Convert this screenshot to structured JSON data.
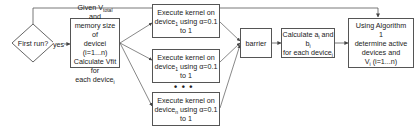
{
  "decision": {
    "label": "First run?",
    "yes_label": "yes",
    "no_label": "no"
  },
  "init_box": {
    "line1_pre": "Given V",
    "line1_sub": "total",
    "line1_post": " and",
    "line2": "memory size of",
    "line3": "devicei (i=1...n)",
    "line4": "Calculate Vfit for",
    "line5_pre": "each device",
    "line5_sub": "i"
  },
  "exec_boxes": [
    {
      "line1": "Execute kernel on",
      "line2_pre": "device",
      "line2_sub": "1",
      "line2_post": " using α=0.1",
      "line3": "to 1"
    },
    {
      "line1": "Execute kernel on",
      "line2_pre": "device",
      "line2_sub": "1",
      "line2_post": " using α=0.1",
      "line3": "to 1"
    },
    {
      "line1": "Execute kernel on",
      "line2_pre": "device",
      "line2_sub": "n",
      "line2_post": " using α=0.1",
      "line3": "to 1"
    }
  ],
  "ellipsis": "• • •",
  "barrier_box": {
    "label": "barrier"
  },
  "calc_box": {
    "line1_pre": "Calculate a",
    "line1_sub": "i",
    "line1_post": " and",
    "line2_pre": "b",
    "line2_sub": "i",
    "line3_pre": "for each device",
    "line3_sub": "i"
  },
  "algo_box": {
    "line1": "Using Algorithm",
    "line2": "1",
    "line3": "determine active",
    "line4": "devices and",
    "line5_pre": "V",
    "line5_sub": "i",
    "line5_post": " (i=1...n)"
  },
  "colors": {
    "stroke": "#555555",
    "text": "#222222",
    "background": "#ffffff"
  }
}
